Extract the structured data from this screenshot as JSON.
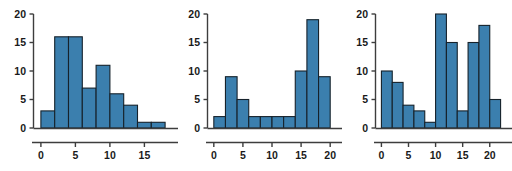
{
  "figure": {
    "background_color": "#ffffff",
    "bar_fill_color": "#3b7fae",
    "bar_edge_color": "#16222b",
    "axis_color": "#3d3d3d",
    "label_color": "#1a1a1a",
    "panel_count": 3
  },
  "chart_data": [
    {
      "type": "bar",
      "title": "",
      "subtitle": "",
      "xlabel": "",
      "ylabel": "",
      "grid": false,
      "legend": false,
      "bin_width": 2,
      "bin_edges": [
        0,
        2,
        4,
        6,
        8,
        10,
        12,
        14,
        16,
        18
      ],
      "categories": [
        "0-2",
        "2-4",
        "4-6",
        "6-8",
        "8-10",
        "10-12",
        "12-14",
        "14-16",
        "16-18"
      ],
      "values": [
        3,
        16,
        16,
        7,
        11,
        6,
        4,
        1,
        1
      ],
      "xlim": [
        -1,
        19
      ],
      "ylim": [
        0,
        20
      ],
      "xticks": [
        0,
        5,
        10,
        15
      ],
      "xtick_labels": [
        "0",
        "5",
        "10",
        "15"
      ],
      "yticks": [
        0,
        5,
        10,
        15,
        20
      ],
      "ytick_labels": [
        "0",
        "5",
        "10",
        "15",
        "20"
      ],
      "shape": "right-skewed"
    },
    {
      "type": "bar",
      "title": "",
      "subtitle": "",
      "xlabel": "",
      "ylabel": "",
      "grid": false,
      "legend": false,
      "bin_width": 2,
      "bin_edges": [
        0,
        2,
        4,
        6,
        8,
        10,
        12,
        14,
        16,
        18,
        20
      ],
      "categories": [
        "0-2",
        "2-4",
        "4-6",
        "6-8",
        "8-10",
        "10-12",
        "12-14",
        "14-16",
        "16-18",
        "18-20"
      ],
      "values": [
        2,
        9,
        5,
        2,
        2,
        2,
        2,
        10,
        19,
        9
      ],
      "xlim": [
        -1,
        21
      ],
      "ylim": [
        0,
        20
      ],
      "xticks": [
        0,
        5,
        10,
        15,
        20
      ],
      "xtick_labels": [
        "0",
        "5",
        "10",
        "15",
        "20"
      ],
      "yticks": [
        0,
        5,
        10,
        15,
        20
      ],
      "ytick_labels": [
        "0",
        "5",
        "10",
        "15",
        "20"
      ],
      "shape": "bimodal"
    },
    {
      "type": "bar",
      "title": "",
      "subtitle": "",
      "xlabel": "",
      "ylabel": "",
      "grid": false,
      "legend": false,
      "bin_width": 2,
      "bin_edges": [
        0,
        2,
        4,
        6,
        8,
        10,
        12,
        14,
        16,
        18,
        20,
        22
      ],
      "categories": [
        "0-2",
        "2-4",
        "4-6",
        "6-8",
        "8-10",
        "10-12",
        "12-14",
        "14-16",
        "16-18",
        "18-20",
        "20-22"
      ],
      "values": [
        10,
        8,
        4,
        3,
        1,
        20,
        15,
        3,
        15,
        18,
        5
      ],
      "xlim": [
        -1,
        23
      ],
      "ylim": [
        0,
        20
      ],
      "xticks": [
        0,
        5,
        10,
        15,
        20
      ],
      "xtick_labels": [
        "0",
        "5",
        "10",
        "15",
        "20"
      ],
      "yticks": [
        0,
        5,
        10,
        15,
        20
      ],
      "ytick_labels": [
        "0",
        "5",
        "10",
        "15",
        "20"
      ],
      "shape": "irregular-multimodal"
    }
  ]
}
